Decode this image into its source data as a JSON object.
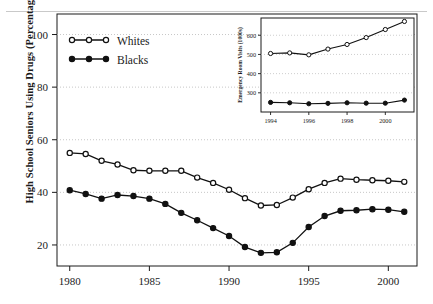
{
  "figure": {
    "axis_color": "#1a1a1a",
    "grid_color": "#b9b9b9",
    "series_color": "#111111"
  },
  "main_axes": {
    "ylabel": "High School Seniors Using Drugs (Percentage)",
    "yticks": [
      20,
      40,
      60,
      80,
      100
    ],
    "ytick_labels": [
      "20",
      "40",
      "60",
      "80",
      "100"
    ],
    "xticks": [
      1980,
      1985,
      1990,
      1995,
      2000
    ],
    "xtick_labels": [
      "1980",
      "1985",
      "1990",
      "1995",
      "2000"
    ],
    "xlim": [
      1979.2,
      2001.8
    ],
    "ylim": [
      12,
      104
    ],
    "legend": [
      {
        "label": "Whites",
        "marker": "open-circle"
      },
      {
        "label": "Blacks",
        "marker": "filled-circle"
      }
    ]
  },
  "inset_axes": {
    "ylabel": "Emergency Room Visits (1000s)",
    "yticks": [
      300,
      400,
      500,
      600
    ],
    "ytick_labels": [
      "300",
      "400",
      "500",
      "600"
    ],
    "xticks": [
      1994,
      1996,
      1998,
      2000
    ],
    "xtick_labels": [
      "1994",
      "1996",
      "1998",
      "2000"
    ],
    "xlim": [
      1993.5,
      2001.5
    ],
    "ylim": [
      200,
      690
    ]
  },
  "chart_data": [
    {
      "type": "line",
      "id": "main",
      "title": "",
      "xlabel": "",
      "ylabel": "High School Seniors Using Drugs (Percentage)",
      "xlim": [
        1979.2,
        2001.8
      ],
      "ylim": [
        12,
        104
      ],
      "grid": true,
      "legend_position": "top-left",
      "x": [
        1980,
        1981,
        1982,
        1983,
        1984,
        1985,
        1986,
        1987,
        1988,
        1989,
        1990,
        1991,
        1992,
        1993,
        1994,
        1995,
        1996,
        1997,
        1998,
        1999,
        2000,
        2001
      ],
      "series": [
        {
          "name": "Whites",
          "marker": "open-circle",
          "values": [
            55.0,
            54.6,
            52.0,
            50.6,
            48.4,
            48.2,
            48.2,
            48.2,
            45.6,
            43.6,
            41.0,
            37.8,
            35.0,
            35.2,
            38.0,
            41.2,
            43.6,
            45.2,
            44.8,
            44.6,
            44.4,
            44.0
          ]
        },
        {
          "name": "Blacks",
          "marker": "filled-circle",
          "values": [
            40.8,
            39.4,
            37.6,
            39.0,
            38.6,
            37.6,
            35.6,
            32.2,
            29.4,
            26.4,
            23.4,
            19.2,
            17.0,
            17.2,
            20.8,
            26.8,
            31.0,
            33.0,
            33.2,
            33.6,
            33.4,
            32.6
          ]
        }
      ]
    },
    {
      "type": "line",
      "id": "inset",
      "title": "",
      "xlabel": "",
      "ylabel": "Emergency Room Visits (1000s)",
      "xlim": [
        1993.5,
        2001.5
      ],
      "ylim": [
        200,
        690
      ],
      "grid": true,
      "legend_position": "none",
      "x": [
        1994,
        1995,
        1996,
        1997,
        1998,
        1999,
        2000,
        2001
      ],
      "series": [
        {
          "name": "Whites",
          "marker": "open-circle",
          "values": [
            505,
            508,
            498,
            528,
            552,
            588,
            630,
            672
          ]
        },
        {
          "name": "Blacks",
          "marker": "filled-circle",
          "values": [
            250,
            248,
            243,
            245,
            248,
            246,
            246,
            262
          ]
        }
      ]
    }
  ]
}
